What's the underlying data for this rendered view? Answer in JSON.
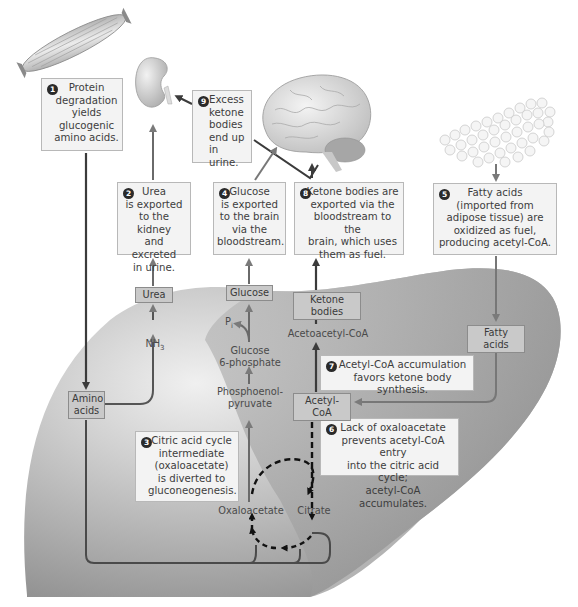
{
  "figure": {
    "colors": {
      "liver_fill": "#9c9c9c",
      "liver_light": "#e6e6e6",
      "callout_bg": "#f3f3f3",
      "tag_bg": "#c9c9c9",
      "arrow_dark": "#3b3b3b",
      "arrow_gray": "#777777",
      "badge": "#2a2a2a"
    },
    "organs": [
      {
        "name": "muscle",
        "icon": "muscle-icon"
      },
      {
        "name": "kidney",
        "icon": "kidney-icon"
      },
      {
        "name": "brain",
        "icon": "brain-icon"
      },
      {
        "name": "adipose tissue",
        "icon": "adipose-icon"
      },
      {
        "name": "liver",
        "icon": "liver-icon"
      }
    ],
    "callouts": [
      {
        "step": "1",
        "text": "Protein\ndegradation\nyields\nglucogenic\namino acids."
      },
      {
        "step": "2",
        "text": "Urea\nis exported\nto the kidney\nand excreted\nin urine."
      },
      {
        "step": "3",
        "text": "Citric acid cycle\nintermediate\n(oxaloacetate)\nis diverted to\ngluconeogenesis."
      },
      {
        "step": "4",
        "text": "Glucose\nis exported\nto the brain\nvia the\nbloodstream."
      },
      {
        "step": "5",
        "text": "Fatty acids\n(imported from\nadipose tissue) are\noxidized as fuel,\nproducing acetyl-CoA."
      },
      {
        "step": "6",
        "text": "Lack of oxaloacetate\nprevents acetyl-CoA entry\ninto the citric acid cycle;\nacetyl-CoA accumulates."
      },
      {
        "step": "7",
        "text": "Acetyl-CoA accumulation\nfavors ketone body synthesis."
      },
      {
        "step": "8",
        "text": "Ketone bodies are\nexported via the\nbloodstream to the\nbrain, which uses\nthem as fuel."
      },
      {
        "step": "9",
        "text": "Excess\nketone\nbodies\nend up\nin urine."
      }
    ],
    "tags": {
      "urea": "Urea",
      "glucose": "Glucose",
      "ketone_bodies": "Ketone bodies",
      "fatty_acids": "Fatty acids",
      "amino_acids": "Amino\nacids",
      "acetyl_coa": "Acetyl-CoA"
    },
    "labels": {
      "nh3": "NH",
      "nh3_sub": "3",
      "pi": "P",
      "pi_sub": "i",
      "glucose_6_phosphate": "Glucose\n6-phosphate",
      "pep": "Phosphoenol-\npyruvate",
      "acetoacetyl_coa": "Acetoacetyl-CoA",
      "oxaloacetate": "Oxaloacetate",
      "citrate": "Citrate"
    }
  }
}
